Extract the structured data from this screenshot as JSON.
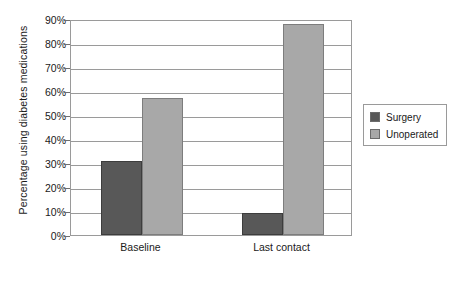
{
  "chart_data": {
    "type": "bar",
    "title": "",
    "subtitle": "",
    "xlabel": "",
    "ylabel": "Percentage using diabetes medications",
    "categories": [
      "Baseline",
      "Last contact"
    ],
    "series": [
      {
        "name": "Surgery",
        "color": "#585858",
        "values": [
          31,
          9
        ]
      },
      {
        "name": "Unoperated",
        "color": "#a8a8a8",
        "values": [
          57,
          88
        ]
      }
    ],
    "ylim": [
      0,
      90
    ],
    "ytick_step": 10,
    "ytick_labels": [
      "0%",
      "10%",
      "20%",
      "30%",
      "40%",
      "50%",
      "60%",
      "70%",
      "80%",
      "90%"
    ],
    "ytick_values": [
      0,
      10,
      20,
      30,
      40,
      50,
      60,
      70,
      80,
      90
    ],
    "grid": true,
    "grid_axis": "y",
    "legend_position": "right",
    "annotations": []
  },
  "legend": {
    "entries": [
      {
        "label": "Surgery"
      },
      {
        "label": "Unoperated"
      }
    ]
  },
  "colors": {
    "surgery": "#585858",
    "unoperated": "#a8a8a8",
    "axis": "#9a9a9a",
    "text": "#1a1a1a",
    "background": "#ffffff"
  }
}
